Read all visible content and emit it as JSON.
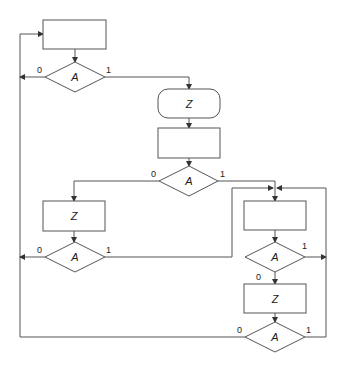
{
  "diagram": {
    "type": "flowchart",
    "colors": {
      "stroke": "#555555",
      "text": "#222222",
      "background": "#ffffff"
    },
    "nodes": [
      {
        "id": "rect-top",
        "shape": "rectangle",
        "label": ""
      },
      {
        "id": "decision-1",
        "shape": "diamond",
        "label": "A",
        "yes_label": "1",
        "no_label": "0"
      },
      {
        "id": "terminal-z",
        "shape": "rounded-rectangle",
        "label": "Z"
      },
      {
        "id": "rect-mid",
        "shape": "rectangle",
        "label": ""
      },
      {
        "id": "decision-2",
        "shape": "diamond",
        "label": "A",
        "yes_label": "1",
        "no_label": "0"
      },
      {
        "id": "process-z-left",
        "shape": "rectangle",
        "label": "Z"
      },
      {
        "id": "decision-left",
        "shape": "diamond",
        "label": "A",
        "yes_label": "1",
        "no_label": "0"
      },
      {
        "id": "rect-right",
        "shape": "rectangle",
        "label": ""
      },
      {
        "id": "decision-right-1",
        "shape": "diamond",
        "label": "A",
        "yes_label": "1",
        "no_label": "0"
      },
      {
        "id": "process-z-right",
        "shape": "rectangle",
        "label": "Z"
      },
      {
        "id": "decision-right-2",
        "shape": "diamond",
        "label": "A",
        "yes_label": "1",
        "no_label": "0"
      }
    ]
  }
}
